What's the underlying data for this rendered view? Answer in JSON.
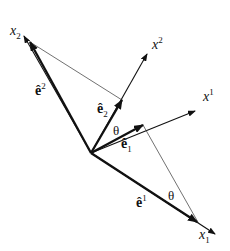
{
  "diagram": {
    "type": "vector-basis-diagram",
    "origin": [
      91,
      153
    ],
    "axes": [
      {
        "id": "x_2",
        "label_base": "x",
        "label_sub": "2",
        "label_sup": "",
        "from": [
          91,
          153
        ],
        "to": [
          24,
          36
        ]
      },
      {
        "id": "x^2",
        "label_base": "x",
        "label_sub": "",
        "label_sup": "2",
        "from": [
          91,
          153
        ],
        "to": [
          147,
          54
        ]
      },
      {
        "id": "x^1",
        "label_base": "x",
        "label_sup": "1",
        "label_sub": "",
        "from": [
          91,
          153
        ],
        "to": [
          195,
          111
        ]
      },
      {
        "id": "x_1",
        "label_base": "x",
        "label_sub": "1",
        "label_sup": "",
        "from": [
          91,
          153
        ],
        "to": [
          215,
          234
        ]
      }
    ],
    "vectors": [
      {
        "id": "e^2",
        "label_base": "ê",
        "label_sup": "2",
        "label_sub": "",
        "from": [
          91,
          153
        ],
        "to": [
          30,
          42
        ]
      },
      {
        "id": "e_2",
        "label_base": "ê",
        "label_sup": "",
        "label_sub": "2",
        "from": [
          91,
          153
        ],
        "to": [
          122,
          100
        ]
      },
      {
        "id": "e_1",
        "label_base": "ê",
        "label_sup": "",
        "label_sub": "1",
        "from": [
          91,
          153
        ],
        "to": [
          143,
          125
        ]
      },
      {
        "id": "e^1",
        "label_base": "ê",
        "label_sup": "1",
        "label_sub": "",
        "from": [
          91,
          153
        ],
        "to": [
          197,
          222
        ]
      }
    ],
    "angle_labels": [
      {
        "text": "θ",
        "position": "between e_2 and e_1"
      },
      {
        "text": "θ",
        "position": "near x_1 tip"
      }
    ],
    "projection_lines": [
      {
        "from": [
          30,
          42
        ],
        "to": [
          122,
          100
        ]
      },
      {
        "from": [
          143,
          125
        ],
        "to": [
          197,
          222
        ]
      }
    ],
    "colors": {
      "stroke": "#111111",
      "thin": "#333333",
      "background": "#ffffff"
    }
  }
}
